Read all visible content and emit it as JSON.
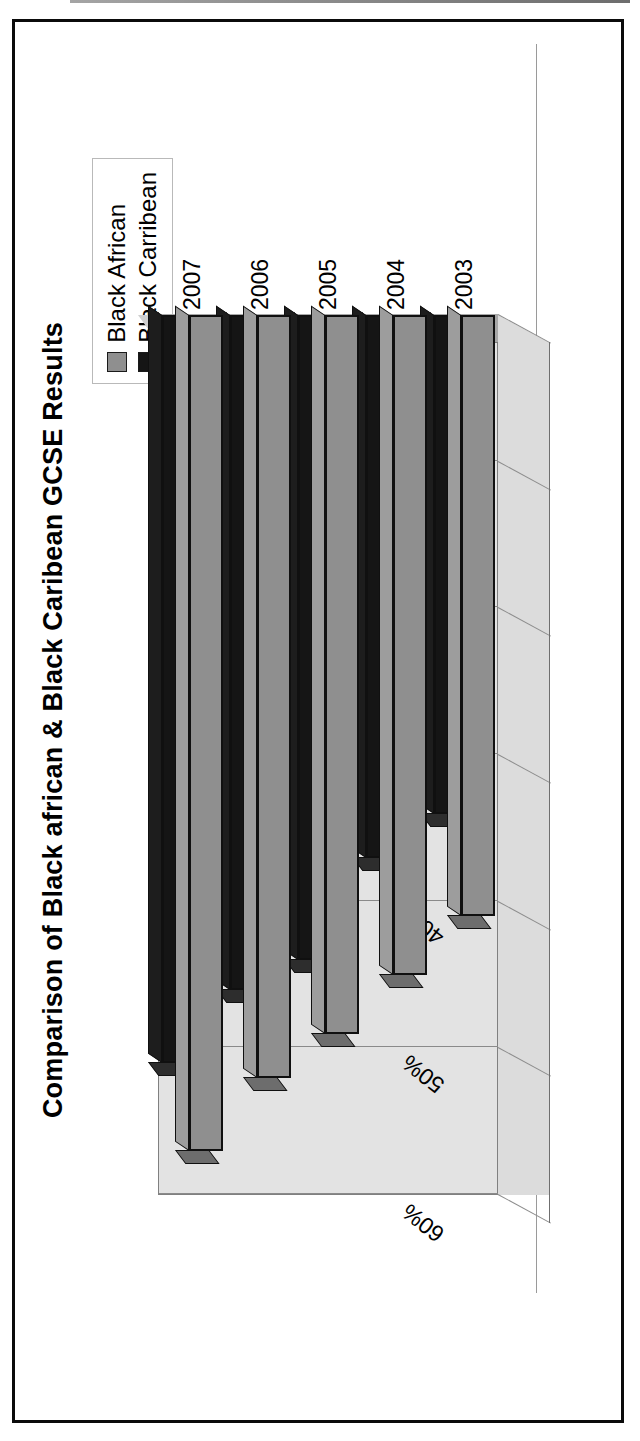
{
  "figure": {
    "title": "Comparison of Black african & Black Caribean GCSE Results"
  },
  "legend": {
    "position": "top-right",
    "items": [
      {
        "label": "Black African",
        "swatch_color": "#8f8f8f",
        "icon": "legend-swatch-icon"
      },
      {
        "label": "Black Carribean",
        "swatch_color": "#151515",
        "icon": "legend-swatch-icon"
      }
    ]
  },
  "axes": {
    "value_axis_ticks": [
      "0%",
      "10%",
      "20%",
      "30%",
      "40%",
      "50%",
      "60%"
    ],
    "category_axis_ticks": [
      "2003",
      "2004",
      "2005",
      "2006",
      "2007"
    ]
  },
  "chart_data": {
    "type": "bar",
    "orientation": "horizontal",
    "style": "3d-clustered-bar",
    "title": "Comparison of Black african & Black Caribean GCSE Results",
    "xlabel": "",
    "ylabel": "",
    "categories": [
      "2003",
      "2004",
      "2005",
      "2006",
      "2007"
    ],
    "series": [
      {
        "name": "Black African",
        "color": "#8f8f8f",
        "values": [
          41,
          45,
          49,
          52,
          57
        ]
      },
      {
        "name": "Black Carribean",
        "color": "#151515",
        "values": [
          34,
          37,
          44,
          46,
          51
        ]
      }
    ],
    "value_unit": "%",
    "xlim": [
      0,
      60
    ],
    "tick_step": 10,
    "grid": true,
    "legend_position": "top-right"
  }
}
